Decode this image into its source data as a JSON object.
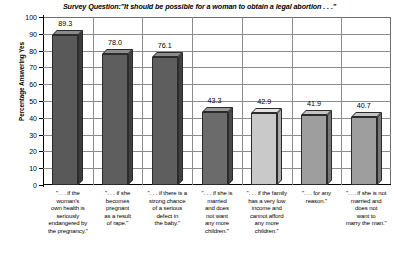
{
  "chart_data": {
    "type": "bar",
    "title_prefix": "Survey Question:",
    "title_quote": "\"It should be possible for a woman to obtain a ",
    "title_emphasis": "legal abortion",
    "title_suffix": " . . .\"",
    "xlabel": "",
    "ylabel": "Percentage Answering Yes",
    "ylim": [
      0,
      100
    ],
    "ytick_step": 10,
    "yticks": [
      "100",
      "90",
      "80",
      "70",
      "60",
      "50",
      "40",
      "30",
      "20",
      "10",
      "0"
    ],
    "grid": true,
    "legend": "none",
    "categories": [
      "\". . . if the woman's own health is seriously endangered by the pregnancy.\"",
      "\". . . if she becomes pregnant as a result of rape.\"",
      "\". . . if there is a strong chance of a serious defect in the baby.\"",
      "\". . . if she is married and does not want any more children.\"",
      "\". . . if the family has a very low income and cannot afford any more children.\"",
      "\". . . for any reason.\"",
      "\". . . if she is not married and does not want to marry the man.\""
    ],
    "category_lines": [
      [
        "\". . . if the",
        "woman's",
        "own health is",
        "seriously",
        "endangered by",
        "the pregnancy.\""
      ],
      [
        "\". . . if she",
        "becomes",
        "pregnant",
        "as a result",
        "of rape.\""
      ],
      [
        "\". . . if there is a",
        "strong chance",
        "of a serious",
        "defect in",
        "the baby.\""
      ],
      [
        "\". . . if she is",
        "married",
        "and does",
        "not want",
        "any more",
        "children.\""
      ],
      [
        "\". . . if the family",
        "has a very low",
        "income and",
        "cannot afford",
        "any more",
        "children.\""
      ],
      [
        "\". . . for any",
        "reason.\""
      ],
      [
        "\". . . if she is not",
        "married and",
        "does not",
        "want to",
        "marry the man.\""
      ]
    ],
    "values": [
      89.3,
      78.0,
      76.1,
      43.3,
      42.9,
      41.9,
      40.7
    ],
    "value_labels": [
      "89.3",
      "78.0",
      "76.1",
      "43.3",
      "42.9",
      "41.9",
      "40.7"
    ],
    "bar_colors": [
      "#595959",
      "#5e5e5e",
      "#5e5e5e",
      "#6b6b6b",
      "#c9c9c9",
      "#9e9e9e",
      "#9e9e9e"
    ],
    "bar_top_colors": [
      "#8a8a8a",
      "#8d8d8d",
      "#8d8d8d",
      "#979797",
      "#e2e2e2",
      "#c4c4c4",
      "#c4c4c4"
    ],
    "bar_side_colors": [
      "#3c3c3c",
      "#404040",
      "#404040",
      "#4a4a4a",
      "#a8a8a8",
      "#767676",
      "#767676"
    ]
  }
}
